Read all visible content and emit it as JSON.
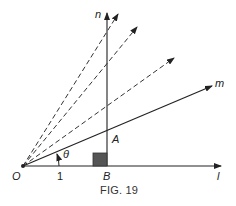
{
  "figure": {
    "caption": "FIG. 19",
    "labels": {
      "origin": "O",
      "unit": "1",
      "foot": "B",
      "intersection": "A",
      "angle": "θ",
      "line_horizontal": "l",
      "line_vertical": "n",
      "line_ray": "m"
    },
    "colors": {
      "stroke": "#222222",
      "square_fill": "#555555",
      "dashed": "#333333"
    },
    "points": {
      "O": [
        23,
        166
      ],
      "B": [
        107,
        166
      ],
      "A": [
        107,
        128
      ]
    },
    "dashed_rays": [
      {
        "to": [
          118,
          16
        ]
      },
      {
        "to": [
          137,
          28
        ]
      },
      {
        "to": [
          174,
          58
        ]
      }
    ]
  }
}
